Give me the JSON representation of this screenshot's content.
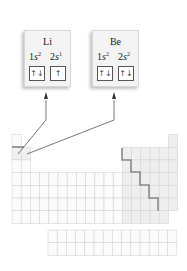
{
  "figure": {
    "cards": [
      {
        "id": "li",
        "symbol": "Li",
        "orbitals": [
          {
            "n": "1",
            "l": "s",
            "count": "2",
            "arrows": "↑↓"
          },
          {
            "n": "2",
            "l": "s",
            "count": "1",
            "arrows": "↑"
          }
        ]
      },
      {
        "id": "be",
        "symbol": "Be",
        "orbitals": [
          {
            "n": "1",
            "l": "s",
            "count": "2",
            "arrows": "↑↓"
          },
          {
            "n": "2",
            "l": "s",
            "count": "2",
            "arrows": "↑↓"
          }
        ]
      }
    ],
    "periodic_table": {
      "columns": 18,
      "main_rows": 7,
      "f_block_rows": 2,
      "highlighted_cells": [
        "Li",
        "Be"
      ],
      "colors": {
        "grid_line": "#d6d6d6",
        "cell_fill": "#fbfbfb",
        "p_block_fill": "#eeeeee",
        "staircase": "#8a8a8a",
        "pointer_line": "#555555"
      }
    }
  }
}
